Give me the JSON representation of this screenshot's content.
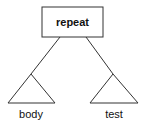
{
  "diagram": {
    "root": {
      "label": "repeat"
    },
    "children": [
      {
        "label": "body"
      },
      {
        "label": "test"
      }
    ],
    "colors": {
      "stroke": "#333333",
      "text": "#111111",
      "background": "#ffffff"
    }
  }
}
